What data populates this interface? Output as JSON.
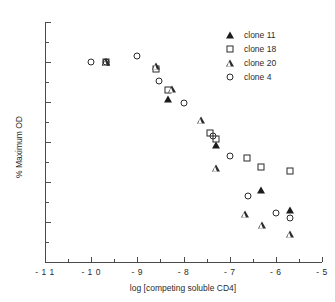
{
  "chart_data": {
    "type": "scatter",
    "title": "",
    "xlabel": "log [competing soluble CD4]",
    "ylabel": "% Maximum OD",
    "xlim": [
      -11,
      -5
    ],
    "ylim": [
      0,
      120
    ],
    "xticks": [
      -11,
      -10,
      -9,
      -8,
      -7,
      -6,
      -5
    ],
    "xticklabels": [
      "- 1 1",
      "- 1 0",
      "- 9",
      "- 8",
      "- 7",
      "- 6",
      "- 5"
    ],
    "yticks": [
      0,
      20,
      40,
      60,
      80,
      100,
      120
    ],
    "yticklabels": [
      "0",
      "20",
      "40",
      "60",
      "80",
      "100",
      "120"
    ],
    "xminor": [
      -10.5,
      -9.5,
      -8.5,
      -7.5,
      -6.5,
      -5.5
    ],
    "yminor": [
      10,
      30,
      50,
      70,
      90,
      110
    ],
    "grid": false,
    "legend_position": "top-right",
    "marker_color": "#2b2b2b",
    "series": [
      {
        "name": "clone 11",
        "marker": "triangle-filled",
        "points": [
          {
            "x": -9.68,
            "y": 100.0
          },
          {
            "x": -8.34,
            "y": 81.5
          },
          {
            "x": -7.3,
            "y": 58.5
          },
          {
            "x": -6.33,
            "y": 35.8
          },
          {
            "x": -5.7,
            "y": 25.8
          }
        ]
      },
      {
        "name": "clone 18",
        "marker": "square-open",
        "points": [
          {
            "x": -9.68,
            "y": 100.0
          },
          {
            "x": -8.6,
            "y": 96.5
          },
          {
            "x": -8.34,
            "y": 86.2
          },
          {
            "x": -7.42,
            "y": 64.3
          },
          {
            "x": -7.3,
            "y": 61.5
          },
          {
            "x": -6.63,
            "y": 52.2
          },
          {
            "x": -6.33,
            "y": 47.5
          },
          {
            "x": -5.7,
            "y": 45.7
          }
        ]
      },
      {
        "name": "clone 20",
        "marker": "triangle-open",
        "points": [
          {
            "x": -9.68,
            "y": 100.0
          },
          {
            "x": -8.6,
            "y": 101.5
          },
          {
            "x": -8.25,
            "y": 93.5
          },
          {
            "x": -7.62,
            "y": 81.7
          },
          {
            "x": -7.3,
            "y": 60.8
          },
          {
            "x": -6.67,
            "y": 41.3
          },
          {
            "x": -6.3,
            "y": 39.5
          },
          {
            "x": -5.7,
            "y": 38.3
          }
        ]
      },
      {
        "name": "clone 4",
        "marker": "circle-open",
        "points": [
          {
            "x": -10.0,
            "y": 100.0
          },
          {
            "x": -9.68,
            "y": 100.0
          },
          {
            "x": -9.0,
            "y": 102.8
          },
          {
            "x": -8.52,
            "y": 90.3
          },
          {
            "x": -8.0,
            "y": 79.5
          },
          {
            "x": -7.37,
            "y": 63.0
          },
          {
            "x": -7.0,
            "y": 52.8
          },
          {
            "x": -6.6,
            "y": 32.8
          },
          {
            "x": -6.0,
            "y": 24.3
          },
          {
            "x": -5.7,
            "y": 21.8
          }
        ]
      }
    ]
  },
  "legend": {
    "entries": [
      {
        "label": "clone 11",
        "marker": "triangle-filled"
      },
      {
        "label": "clone 18",
        "marker": "square-open"
      },
      {
        "label": "clone 20",
        "marker": "triangle-open"
      },
      {
        "label": "clone 4",
        "marker": "circle-open"
      }
    ]
  }
}
